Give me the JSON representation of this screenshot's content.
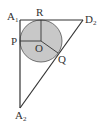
{
  "diagram": {
    "type": "geometry",
    "colors": {
      "stroke": "#333333",
      "circle_fill": "#c8c8c8",
      "background": "#ffffff"
    },
    "points": {
      "A1": {
        "label": "A",
        "sub": "1",
        "x": 20,
        "y": 20
      },
      "D2": {
        "label": "D",
        "sub": "2",
        "x": 83,
        "y": 20
      },
      "A2": {
        "label": "A",
        "sub": "2",
        "x": 20,
        "y": 108
      },
      "O": {
        "label": "O",
        "x": 41,
        "y": 41
      },
      "P": {
        "label": "P",
        "x": 20,
        "y": 41
      },
      "R": {
        "label": "R",
        "x": 41,
        "y": 20
      },
      "Q": {
        "label": "Q",
        "x": 57,
        "y": 53
      }
    },
    "circle": {
      "center": "O",
      "radius": 21
    },
    "segments": [
      [
        "A1",
        "D2"
      ],
      [
        "A1",
        "A2"
      ],
      [
        "A2",
        "D2"
      ],
      [
        "O",
        "P"
      ],
      [
        "O",
        "R"
      ],
      [
        "O",
        "Q"
      ]
    ]
  }
}
